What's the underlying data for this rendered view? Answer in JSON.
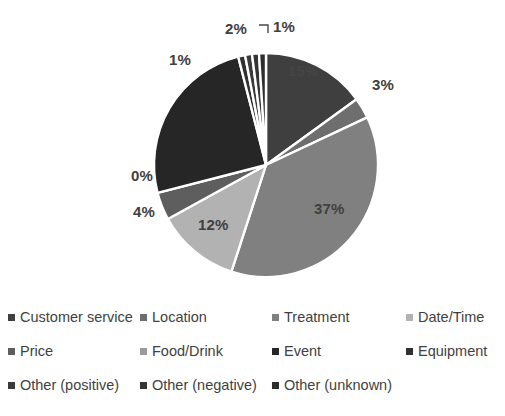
{
  "chart_data": {
    "type": "pie",
    "title": "",
    "legend_position": "bottom",
    "grid": false,
    "categories": [
      "Customer service",
      "Location",
      "Treatment",
      "Date/Time",
      "Price",
      "Food/Drink",
      "Event",
      "Equipment",
      "Other (positive)",
      "Other (negative)",
      "Other (unknown)"
    ],
    "values": [
      15,
      3,
      37,
      12,
      4,
      0,
      25,
      1,
      1,
      1,
      1
    ],
    "labels": [
      "15%",
      "3%",
      "37%",
      "12%",
      "4%",
      "0%",
      "",
      "1%",
      "1%",
      "2%",
      "1%"
    ],
    "colors": [
      "#3f3f3f",
      "#6e6e6e",
      "#808080",
      "#b2b2b2",
      "#5e5e5e",
      "#9a9a9a",
      "#262626",
      "#303030",
      "#3a3a3a",
      "#343434",
      "#2e2e2e"
    ],
    "slice_separator_color": "#ffffff"
  },
  "slice_labels": [
    {
      "name": "customer-service",
      "text": "15%",
      "x": 288,
      "y": 62,
      "inside": true
    },
    {
      "name": "location",
      "text": "3%",
      "x": 372,
      "y": 76,
      "inside": false
    },
    {
      "name": "treatment",
      "text": "37%",
      "x": 314,
      "y": 200,
      "inside": true
    },
    {
      "name": "date-time",
      "text": "12%",
      "x": 198,
      "y": 216,
      "inside": true
    },
    {
      "name": "price",
      "text": "4%",
      "x": 133,
      "y": 203,
      "inside": false
    },
    {
      "name": "food-drink",
      "text": "0%",
      "x": 131,
      "y": 167,
      "inside": false
    },
    {
      "name": "equipment",
      "text": "1%",
      "x": 169,
      "y": 51,
      "inside": false
    },
    {
      "name": "other-positive",
      "text": "2%",
      "x": 225,
      "y": 20,
      "inside": false
    },
    {
      "name": "other-negative",
      "text": "1%",
      "x": 273,
      "y": 18,
      "inside": false
    }
  ],
  "legend": {
    "rows": [
      [
        {
          "label": "Customer service",
          "color": "#3f3f3f",
          "x": 8
        },
        {
          "label": "Location",
          "color": "#6e6e6e",
          "x": 140
        },
        {
          "label": "Treatment",
          "color": "#808080",
          "x": 272
        },
        {
          "label": "Date/Time",
          "color": "#b2b2b2",
          "x": 406
        }
      ],
      [
        {
          "label": "Price",
          "color": "#5e5e5e",
          "x": 8
        },
        {
          "label": "Food/Drink",
          "color": "#9a9a9a",
          "x": 140
        },
        {
          "label": "Event",
          "color": "#262626",
          "x": 272
        },
        {
          "label": "Equipment",
          "color": "#303030",
          "x": 406
        }
      ],
      [
        {
          "label": "Other (positive)",
          "color": "#3a3a3a",
          "x": 8
        },
        {
          "label": "Other (negative)",
          "color": "#343434",
          "x": 140
        },
        {
          "label": "Other (unknown)",
          "color": "#2e2e2e",
          "x": 272
        }
      ]
    ]
  }
}
